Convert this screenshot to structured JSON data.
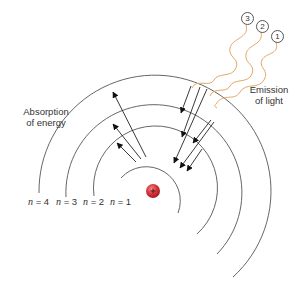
{
  "diagram": {
    "type": "bohr-atom-energy-levels",
    "labels": {
      "absorption_line1": "Absorption",
      "absorption_line2": "of energy",
      "emission_line1": "Emission",
      "emission_line2": "of light"
    },
    "levels": [
      {
        "n": "1",
        "label_prefix": "n",
        "label_rest": " = 1",
        "radius": 34
      },
      {
        "n": "2",
        "label_prefix": "n",
        "label_rest": " = 2",
        "radius": 62
      },
      {
        "n": "3",
        "label_prefix": "n",
        "label_rest": " = 3",
        "radius": 88
      },
      {
        "n": "4",
        "label_prefix": "n",
        "label_rest": " = 4",
        "radius": 116
      }
    ],
    "photons": [
      {
        "id": "1",
        "label": "1"
      },
      {
        "id": "2",
        "label": "2"
      },
      {
        "id": "3",
        "label": "3"
      }
    ],
    "nucleus": {
      "symbol": "+",
      "color": "#d9343a"
    },
    "colors": {
      "orbit": "#444444",
      "arrow": "#222222",
      "photon": "#e0a060",
      "text": "#333333"
    }
  }
}
